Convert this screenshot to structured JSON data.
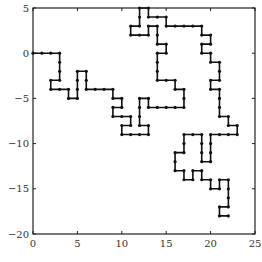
{
  "chart_data": {
    "type": "line",
    "title": "",
    "xlabel": "",
    "ylabel": "",
    "xlim": [
      0,
      25
    ],
    "ylim": [
      -20,
      5
    ],
    "grid": false,
    "legend": null,
    "x_ticks": [
      0,
      5,
      10,
      15,
      20,
      25
    ],
    "y_ticks": [
      5,
      0,
      -5,
      -10,
      -15,
      -20
    ],
    "x_tick_labels": [
      "0",
      "5",
      "10",
      "15",
      "20",
      "25"
    ],
    "y_tick_labels": [
      "5",
      "0",
      "−5",
      "−10",
      "−15",
      "−20"
    ],
    "series": [
      {
        "name": "lattice random walk",
        "marker": "dot",
        "color": "#111111",
        "x": [
          0,
          1,
          2,
          3,
          3,
          3,
          3,
          2,
          2,
          3,
          4,
          4,
          5,
          5,
          5,
          5,
          6,
          6,
          6,
          7,
          8,
          9,
          9,
          10,
          10,
          9,
          9,
          10,
          11,
          11,
          10,
          10,
          11,
          12,
          13,
          13,
          12,
          12,
          12,
          12,
          13,
          13,
          14,
          15,
          16,
          17,
          17,
          17,
          16,
          16,
          15,
          14,
          14,
          14,
          14,
          15,
          15,
          14,
          14,
          14,
          13,
          13,
          12,
          11,
          11,
          12,
          12,
          12,
          13,
          13,
          14,
          15,
          15,
          16,
          17,
          18,
          19,
          19,
          20,
          20,
          19,
          19,
          20,
          20,
          21,
          21,
          21,
          20,
          20,
          21,
          21,
          21,
          21,
          22,
          22,
          23,
          23,
          22,
          21,
          20,
          20,
          20,
          20,
          19,
          19,
          19,
          19,
          18,
          17,
          17,
          17,
          16,
          16,
          16,
          17,
          17,
          18,
          18,
          19,
          19,
          20,
          20,
          21,
          21,
          22,
          22,
          22,
          22,
          21,
          21,
          22
        ],
        "y": [
          0,
          0,
          0,
          0,
          -1,
          -2,
          -3,
          -3,
          -4,
          -4,
          -4,
          -5,
          -5,
          -4,
          -3,
          -2,
          -2,
          -3,
          -4,
          -4,
          -4,
          -4,
          -5,
          -5,
          -6,
          -6,
          -7,
          -7,
          -7,
          -8,
          -8,
          -9,
          -9,
          -9,
          -9,
          -8,
          -8,
          -7,
          -6,
          -5,
          -5,
          -6,
          -6,
          -6,
          -6,
          -6,
          -5,
          -4,
          -4,
          -3,
          -3,
          -3,
          -2,
          -1,
          0,
          0,
          1,
          1,
          2,
          3,
          3,
          2,
          2,
          2,
          3,
          3,
          4,
          5,
          5,
          4,
          4,
          4,
          3,
          3,
          3,
          3,
          3,
          2,
          2,
          1,
          1,
          0,
          0,
          -1,
          -1,
          -2,
          -3,
          -3,
          -4,
          -4,
          -5,
          -6,
          -7,
          -7,
          -8,
          -8,
          -9,
          -9,
          -9,
          -9,
          -10,
          -11,
          -12,
          -12,
          -11,
          -10,
          -9,
          -9,
          -9,
          -10,
          -11,
          -11,
          -12,
          -13,
          -13,
          -14,
          -14,
          -13,
          -13,
          -14,
          -14,
          -15,
          -15,
          -14,
          -14,
          -15,
          -16,
          -17,
          -17,
          -18,
          -18
        ]
      }
    ]
  },
  "plot_area": {
    "left": 33,
    "right": 255,
    "top": 8,
    "bottom": 234
  }
}
